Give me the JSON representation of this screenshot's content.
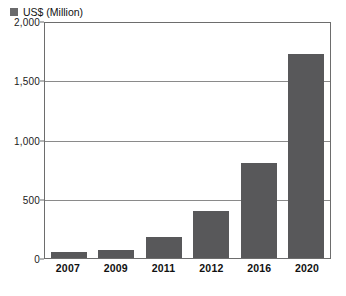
{
  "chart_data": {
    "type": "bar",
    "title": "",
    "xlabel": "",
    "ylabel": "",
    "categories": [
      "2007",
      "2009",
      "2011",
      "2012",
      "2016",
      "2020"
    ],
    "values": [
      50,
      70,
      180,
      400,
      800,
      1720
    ],
    "series": [
      {
        "name": "US$ (Million)",
        "values": [
          50,
          70,
          180,
          400,
          800,
          1720
        ],
        "color": "#58585a"
      }
    ],
    "ylim": [
      0,
      2000
    ],
    "y_ticks": [
      0,
      500,
      1000,
      1500,
      2000
    ],
    "y_tick_labels": [
      "0",
      "500",
      "1,000",
      "1,500",
      "2,000"
    ],
    "grid": true,
    "legend_position": "top-left-inside"
  },
  "legend": {
    "label": "US$ (Million)",
    "swatch_color": "#6a6a6c"
  },
  "axes": {
    "y_max": 2000,
    "y_min": 0,
    "y_tick_labels": [
      "2,000",
      "1,500",
      "1,000",
      "500",
      "0"
    ],
    "y_tick_values": [
      2000,
      1500,
      1000,
      500,
      0
    ],
    "x_tick_labels": [
      "2007",
      "2009",
      "2011",
      "2012",
      "2016",
      "2020"
    ]
  },
  "colors": {
    "bar": "#58585a",
    "frame": "#6d6d6d",
    "gridline": "#8a8a8a",
    "plot_background": "#ffffff",
    "text": "#111111"
  },
  "caption": {
    "text": ""
  }
}
